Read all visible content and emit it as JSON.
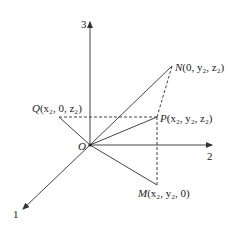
{
  "diagram": {
    "type": "3d-coordinate-system",
    "axes": {
      "x": {
        "label": "1"
      },
      "y": {
        "label": "2"
      },
      "z": {
        "label": "3"
      }
    },
    "origin": {
      "label": "O"
    },
    "points": {
      "N": {
        "name": "N",
        "coords": "(0,  y₂,  z₂)"
      },
      "P": {
        "name": "P",
        "coords": "(x₂,  y₂,  z₂)"
      },
      "Q": {
        "name": "Q",
        "coords": "(x₂,  0,  z₂)"
      },
      "M": {
        "name": "M",
        "coords": "(x₂,  y₂,  0)"
      }
    },
    "colors": {
      "line": "#333333",
      "text": "#222222"
    }
  }
}
